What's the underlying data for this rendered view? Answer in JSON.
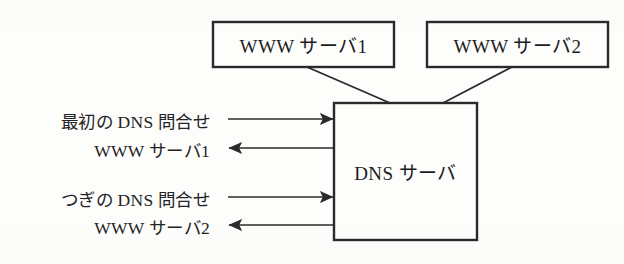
{
  "diagram": {
    "background_color": "#fdfdfb",
    "stroke_color": "#2a2a2a",
    "text_color": "#1c1c1c",
    "nodes": [
      {
        "id": "www-server-1",
        "label": "WWW サーバ1",
        "shape": "rectangle",
        "x": 213,
        "y": 22,
        "width": 181,
        "height": 45
      },
      {
        "id": "www-server-2",
        "label": "WWW サーバ2",
        "shape": "rectangle",
        "x": 427,
        "y": 22,
        "width": 181,
        "height": 45
      },
      {
        "id": "dns-server",
        "label": "DNS サーバ",
        "shape": "rectangle",
        "x": 334,
        "y": 103,
        "width": 143,
        "height": 137
      }
    ],
    "connectors": [
      {
        "id": "link-www1-to-dns",
        "from": "www-server-1",
        "to": "dns-server",
        "style": "plain-line",
        "x1": 307,
        "y1": 67,
        "x2": 390,
        "y2": 103
      },
      {
        "id": "link-www2-to-dns",
        "from": "www-server-2",
        "to": "dns-server",
        "style": "plain-line",
        "x1": 512,
        "y1": 67,
        "x2": 443,
        "y2": 103
      }
    ],
    "flows": [
      {
        "id": "flow-first-dns-query",
        "label": "最初の DNS 問合せ",
        "direction": "right",
        "label_x": 22,
        "label_y": 108,
        "label_width": 188,
        "x1": 228,
        "x2": 333,
        "y": 119
      },
      {
        "id": "flow-first-dns-answer",
        "label": "WWW サーバ1",
        "direction": "left",
        "label_x": 22,
        "label_y": 137,
        "label_width": 188,
        "x1": 333,
        "x2": 229,
        "y": 148
      },
      {
        "id": "flow-next-dns-query",
        "label": "つぎの DNS 問合せ",
        "direction": "right",
        "label_x": 22,
        "label_y": 186,
        "label_width": 188,
        "x1": 228,
        "x2": 333,
        "y": 197
      },
      {
        "id": "flow-next-dns-answer",
        "label": "WWW サーバ2",
        "direction": "left",
        "label_x": 22,
        "label_y": 214,
        "label_width": 188,
        "x1": 333,
        "x2": 229,
        "y": 225
      }
    ]
  }
}
